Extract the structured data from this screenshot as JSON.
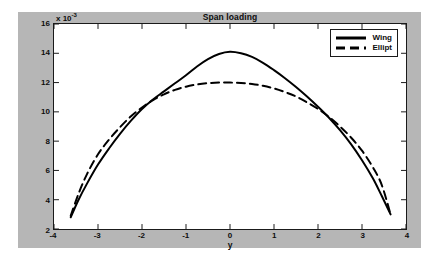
{
  "chart_data": {
    "type": "line",
    "title": "Span loading",
    "xlabel": "y",
    "ylabel": "",
    "y_exponent_label": "x 10",
    "y_exponent_power": "-3",
    "xlim": [
      -4,
      4
    ],
    "ylim": [
      2,
      16
    ],
    "xticks": [
      "-4",
      "-3",
      "-2",
      "-1",
      "0",
      "1",
      "2",
      "3",
      "4"
    ],
    "xtick_values": [
      -4,
      -3,
      -2,
      -1,
      0,
      1,
      2,
      3,
      4
    ],
    "yticks": [
      "2",
      "4",
      "6",
      "8",
      "10",
      "12",
      "14",
      "16"
    ],
    "ytick_values": [
      2,
      4,
      6,
      8,
      10,
      12,
      14,
      16
    ],
    "grid": false,
    "legend_position": "top-right",
    "series": [
      {
        "name": "Wing",
        "style": "solid",
        "color": "#000000",
        "x": [
          -3.62,
          -3.45,
          -3.25,
          -3.0,
          -2.75,
          -2.5,
          -2.25,
          -2.0,
          -1.75,
          -1.5,
          -1.25,
          -1.0,
          -0.75,
          -0.5,
          -0.25,
          0.0,
          0.25,
          0.5,
          0.75,
          1.0,
          1.25,
          1.5,
          1.75,
          2.0,
          2.25,
          2.5,
          2.75,
          3.0,
          3.25,
          3.45,
          3.65
        ],
        "values": [
          2.8,
          3.95,
          5.1,
          6.4,
          7.5,
          8.5,
          9.4,
          10.2,
          10.85,
          11.4,
          11.95,
          12.5,
          13.1,
          13.6,
          13.95,
          14.1,
          14.0,
          13.75,
          13.35,
          12.85,
          12.3,
          11.7,
          11.05,
          10.35,
          9.6,
          8.75,
          7.8,
          6.7,
          5.45,
          4.25,
          3.0
        ]
      },
      {
        "name": "Ellipt",
        "style": "dashed",
        "color": "#000000",
        "x": [
          -3.62,
          -3.45,
          -3.25,
          -3.0,
          -2.75,
          -2.5,
          -2.25,
          -2.0,
          -1.75,
          -1.5,
          -1.25,
          -1.0,
          -0.75,
          -0.5,
          -0.25,
          0.0,
          0.25,
          0.5,
          0.75,
          1.0,
          1.25,
          1.5,
          1.75,
          2.0,
          2.25,
          2.5,
          2.75,
          3.0,
          3.25,
          3.45,
          3.65
        ],
        "values": [
          2.9,
          4.35,
          5.75,
          7.1,
          8.1,
          8.95,
          9.7,
          10.3,
          10.8,
          11.2,
          11.5,
          11.72,
          11.87,
          11.96,
          12.0,
          12.0,
          11.97,
          11.9,
          11.78,
          11.6,
          11.35,
          11.05,
          10.65,
          10.2,
          9.65,
          9.0,
          8.25,
          7.35,
          6.2,
          5.0,
          3.0
        ]
      }
    ]
  },
  "legend": {
    "entries": [
      {
        "label": "Wing",
        "style": "solid"
      },
      {
        "label": "Ellipt",
        "style": "dashed"
      }
    ]
  }
}
